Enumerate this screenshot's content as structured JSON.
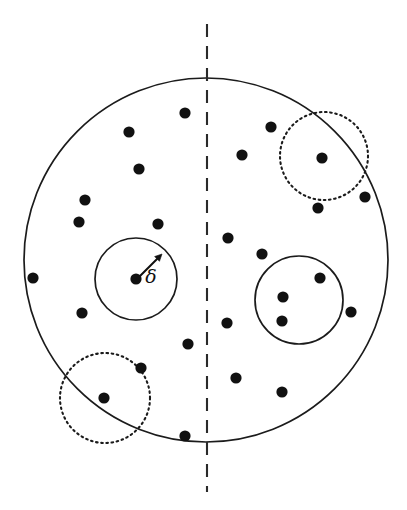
{
  "figure": {
    "width": 407,
    "height": 510,
    "background_color": "#ffffff",
    "stroke_color": "#1b1b1b",
    "dot_color": "#111111"
  },
  "domain_boundary": {
    "name": "outer-circle",
    "shape": "circle",
    "cx": 206,
    "cy": 260,
    "r": 182,
    "style": "solid"
  },
  "split_line": {
    "name": "vertical-dashed-divider",
    "orientation": "vertical",
    "x": 207,
    "y1": 24,
    "y2": 492,
    "style": "dashed"
  },
  "radius_annotation": {
    "label": "δ",
    "label_x": 151,
    "label_y": 283,
    "arrow_from_x": 137,
    "arrow_from_y": 279,
    "arrow_to_x": 162,
    "arrow_to_y": 254,
    "describes": "delta-radius-of-neighborhood-circle"
  },
  "clusters": [
    {
      "name": "delta-circle-left",
      "style": "solid",
      "cx": 136,
      "cy": 279,
      "r": 41,
      "contained_points": 1
    },
    {
      "name": "cluster-circle-right",
      "style": "solid",
      "cx": 299,
      "cy": 300,
      "r": 44,
      "contained_points": 3
    },
    {
      "name": "dotted-circle-top-right",
      "style": "dotted",
      "cx": 324,
      "cy": 156,
      "r": 44,
      "contained_points": 1
    },
    {
      "name": "dotted-circle-bottom-left",
      "style": "dotted",
      "cx": 105,
      "cy": 398,
      "r": 45,
      "contained_points": 1
    }
  ],
  "point_radius": 5.6,
  "points": [
    {
      "id": "p01",
      "x": 185,
      "y": 113,
      "side": "left"
    },
    {
      "id": "p02",
      "x": 129,
      "y": 132,
      "side": "left"
    },
    {
      "id": "p03",
      "x": 139,
      "y": 169,
      "side": "left"
    },
    {
      "id": "p04",
      "x": 85,
      "y": 200,
      "side": "left"
    },
    {
      "id": "p05",
      "x": 79,
      "y": 222,
      "side": "left"
    },
    {
      "id": "p06",
      "x": 158,
      "y": 224,
      "side": "left"
    },
    {
      "id": "p07",
      "x": 33,
      "y": 278,
      "side": "left"
    },
    {
      "id": "p08",
      "x": 136,
      "y": 279,
      "side": "left",
      "cluster": "delta-circle-left"
    },
    {
      "id": "p09",
      "x": 82,
      "y": 313,
      "side": "left"
    },
    {
      "id": "p10",
      "x": 188,
      "y": 344,
      "side": "left"
    },
    {
      "id": "p11",
      "x": 141,
      "y": 368,
      "side": "left"
    },
    {
      "id": "p12",
      "x": 104,
      "y": 398,
      "side": "left",
      "cluster": "dotted-circle-bottom-left"
    },
    {
      "id": "p13",
      "x": 185,
      "y": 436,
      "side": "left"
    },
    {
      "id": "p14",
      "x": 271,
      "y": 127,
      "side": "right"
    },
    {
      "id": "p15",
      "x": 242,
      "y": 155,
      "side": "right"
    },
    {
      "id": "p16",
      "x": 322,
      "y": 158,
      "side": "right",
      "cluster": "dotted-circle-top-right"
    },
    {
      "id": "p17",
      "x": 365,
      "y": 197,
      "side": "right"
    },
    {
      "id": "p18",
      "x": 318,
      "y": 208,
      "side": "right"
    },
    {
      "id": "p19",
      "x": 228,
      "y": 238,
      "side": "right"
    },
    {
      "id": "p20",
      "x": 262,
      "y": 254,
      "side": "right"
    },
    {
      "id": "p21",
      "x": 320,
      "y": 278,
      "side": "right",
      "cluster": "cluster-circle-right"
    },
    {
      "id": "p22",
      "x": 283,
      "y": 297,
      "side": "right",
      "cluster": "cluster-circle-right"
    },
    {
      "id": "p23",
      "x": 351,
      "y": 312,
      "side": "right"
    },
    {
      "id": "p24",
      "x": 282,
      "y": 321,
      "side": "right",
      "cluster": "cluster-circle-right"
    },
    {
      "id": "p25",
      "x": 227,
      "y": 323,
      "side": "right"
    },
    {
      "id": "p26",
      "x": 236,
      "y": 378,
      "side": "right"
    },
    {
      "id": "p27",
      "x": 282,
      "y": 392,
      "side": "right"
    }
  ]
}
